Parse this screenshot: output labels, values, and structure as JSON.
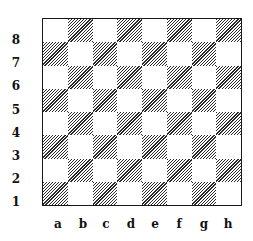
{
  "diagram": {
    "type": "chessboard",
    "ranks": [
      "8",
      "7",
      "6",
      "5",
      "4",
      "3",
      "2",
      "1"
    ],
    "files": [
      "a",
      "b",
      "c",
      "d",
      "e",
      "f",
      "g",
      "h"
    ],
    "dark_square_style": "diagonal-hatch",
    "light_square_color": "#ffffff",
    "dark_square_color": "#2a2a2a",
    "pieces": []
  }
}
